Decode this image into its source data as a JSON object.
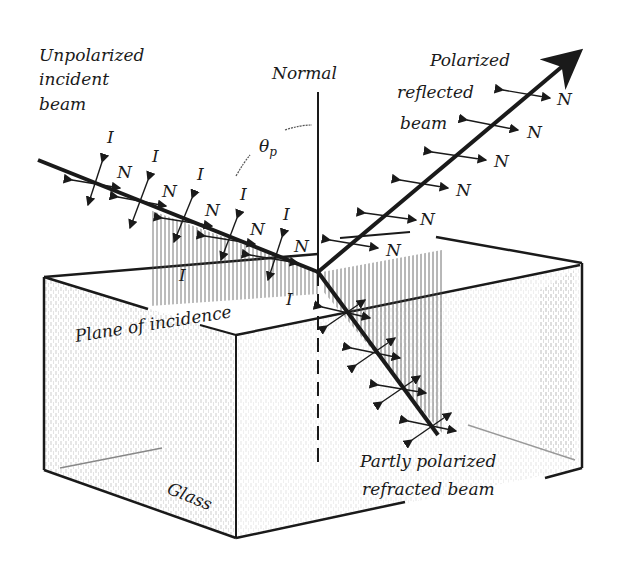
{
  "diagram": {
    "labels": {
      "incident_line1": "Unpolarized",
      "incident_line2": "incident",
      "incident_line3": "beam",
      "normal": "Normal",
      "reflected_line1": "Polarized",
      "reflected_line2": "reflected",
      "reflected_line3": "beam",
      "angle": "θ",
      "angle_sub": "p",
      "plane": "Plane of incidence",
      "glass": "Glass",
      "refracted_line1": "Partly polarized",
      "refracted_line2": "refracted beam"
    },
    "symbols": {
      "in_plane": "I",
      "normal_to_plane": "N"
    },
    "colors": {
      "ink": "#1a1a1a",
      "shade": "#8a8a8a",
      "background": "#ffffff"
    }
  }
}
